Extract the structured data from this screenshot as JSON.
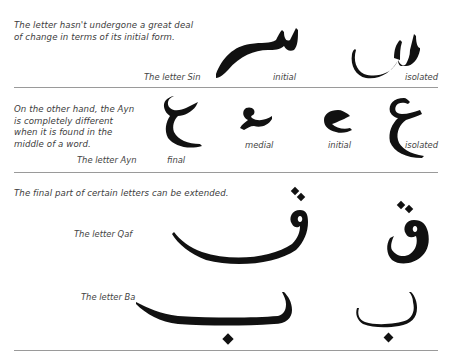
{
  "sections": [
    {
      "id": "sin",
      "description": "The letter hasn't undergone a great deal of change in terms of its initial form.",
      "letter_label": "The letter Sin",
      "forms": [
        {
          "name": "initial",
          "glyph": "سـ"
        },
        {
          "name": "isolated",
          "glyph": "س"
        }
      ]
    },
    {
      "id": "ayn",
      "description": "On the other hand, the Ayn is completely different when it is found in the middle of a word.",
      "letter_label": "The letter Ayn",
      "forms": [
        {
          "name": "final",
          "glyph": "ـع"
        },
        {
          "name": "medial",
          "glyph": "ـعـ"
        },
        {
          "name": "initial",
          "glyph": "عـ"
        },
        {
          "name": "isolated",
          "glyph": "ع"
        }
      ]
    },
    {
      "id": "extended",
      "description": "The final part of certain letters can be extended.",
      "letters": [
        {
          "letter_label": "The letter Qaf",
          "extended_glyph": "ـق",
          "isolated_glyph": "ق"
        },
        {
          "letter_label": "The letter Ba",
          "extended_glyph": "ـب",
          "isolated_glyph": "ب"
        }
      ]
    }
  ]
}
